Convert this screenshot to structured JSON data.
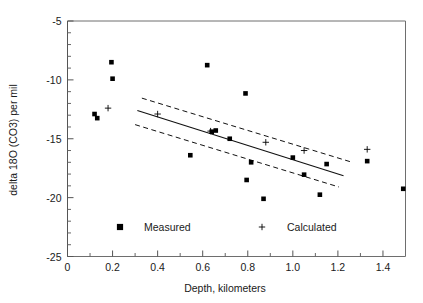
{
  "chart_data": {
    "type": "scatter",
    "title": "",
    "xlabel": "Depth,  kilometers",
    "ylabel": "delta 18O (CO3)  per mil",
    "xlim": [
      0,
      1.5
    ],
    "ylim": [
      -25,
      -5
    ],
    "xticks": [
      0,
      0.2,
      0.4,
      0.6,
      0.8,
      1.0,
      1.2,
      1.4
    ],
    "xticklabels": [
      "0",
      "0.2",
      "0.4",
      "0.6",
      "0.8",
      "1.0",
      "1.2",
      "1.4"
    ],
    "yticks": [
      -5,
      -10,
      -15,
      -20,
      -25
    ],
    "yticklabels": [
      "-5",
      "-10",
      "-15",
      "-20",
      "-25"
    ],
    "minor_xticks": [
      0.1,
      0.3,
      0.5,
      0.7,
      0.9,
      1.1,
      1.3,
      1.5
    ],
    "minor_yticks": [
      -6,
      -7,
      -8,
      -9,
      -11,
      -12,
      -13,
      -14,
      -16,
      -17,
      -18,
      -19,
      -21,
      -22,
      -23,
      -24
    ],
    "grid": false,
    "legend_position": "lower-center-inside",
    "series": [
      {
        "name": "Measured",
        "marker": "square",
        "color": "#000000",
        "points": [
          [
            0.12,
            -12.9
          ],
          [
            0.132,
            -13.25
          ],
          [
            0.195,
            -8.5
          ],
          [
            0.2,
            -9.9
          ],
          [
            0.545,
            -16.4
          ],
          [
            0.62,
            -8.75
          ],
          [
            0.64,
            -14.4
          ],
          [
            0.658,
            -14.3
          ],
          [
            0.72,
            -15.0
          ],
          [
            0.79,
            -11.15
          ],
          [
            0.795,
            -18.5
          ],
          [
            0.815,
            -17.0
          ],
          [
            0.87,
            -20.1
          ],
          [
            1.0,
            -16.6
          ],
          [
            1.05,
            -18.05
          ],
          [
            1.12,
            -19.75
          ],
          [
            1.15,
            -17.15
          ],
          [
            1.33,
            -16.9
          ],
          [
            1.49,
            -19.25
          ]
        ]
      },
      {
        "name": "Calculated",
        "marker": "plus",
        "color": "#000000",
        "points": [
          [
            0.18,
            -12.4
          ],
          [
            0.4,
            -12.9
          ],
          [
            0.635,
            -14.35
          ],
          [
            0.88,
            -15.3
          ],
          [
            1.05,
            -16.0
          ],
          [
            1.33,
            -15.9
          ]
        ]
      }
    ],
    "fit_line": {
      "name": "regression",
      "style": "solid",
      "x": [
        0.31,
        1.225
      ],
      "y": [
        -12.6,
        -18.15
      ]
    },
    "confidence_bands": [
      {
        "name": "upper-confidence-band",
        "style": "dashed",
        "x": [
          0.33,
          1.255
        ],
        "y": [
          -11.55,
          -16.95
        ]
      },
      {
        "name": "lower-confidence-band",
        "style": "dashed",
        "x": [
          0.3,
          1.205
        ],
        "y": [
          -13.8,
          -19.1
        ]
      }
    ],
    "legend": [
      {
        "label": "Measured",
        "marker": "square"
      },
      {
        "label": "Calculated",
        "marker": "plus"
      }
    ]
  }
}
